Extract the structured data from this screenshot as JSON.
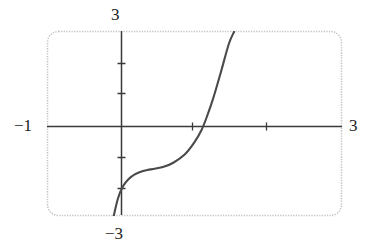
{
  "chart_data": {
    "type": "line",
    "title": "",
    "subtitle": "",
    "xlabel": "",
    "ylabel": "",
    "xlim": [
      -1,
      3
    ],
    "ylim": [
      -3,
      3
    ],
    "grid": false,
    "legend": null,
    "axis_labels": {
      "top": "3",
      "bottom": "−3",
      "left": "−1",
      "right": "3"
    },
    "xticks": [
      1,
      2
    ],
    "yticks": [
      -2,
      1,
      2
    ],
    "x_axis_value": 0,
    "y_axis_value": 0,
    "x_intercept": 1.22,
    "inflection_point": [
      0.35,
      -1.35
    ],
    "series": [
      {
        "name": "curve",
        "x": [
          -0.12,
          -0.05,
          0.02,
          0.1,
          0.18,
          0.27,
          0.35,
          0.45,
          0.57,
          0.7,
          0.85,
          0.98,
          1.08,
          1.16,
          1.24,
          1.34,
          1.45,
          1.52
        ],
        "y": [
          -3.0,
          -2.3,
          -1.9,
          -1.66,
          -1.52,
          -1.43,
          -1.38,
          -1.34,
          -1.28,
          -1.15,
          -0.9,
          -0.52,
          -0.12,
          0.35,
          0.9,
          1.7,
          2.62,
          3.0
        ]
      }
    ],
    "colors": {
      "curve": "#4a4a4a",
      "axis": "#3a3a3a",
      "frame": "#c4c4c4",
      "text": "#1d1d1d",
      "background": "#ffffff"
    }
  }
}
